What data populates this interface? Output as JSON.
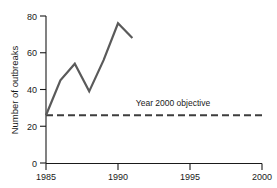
{
  "chart_data": {
    "type": "line",
    "title": "",
    "xlabel": "",
    "ylabel": "Number of outbreaks",
    "xlim": [
      1985,
      2000
    ],
    "ylim": [
      0,
      80
    ],
    "xticks": [
      "1985",
      "1990",
      "1995",
      "2000"
    ],
    "xtick_values": [
      1985,
      1990,
      1995,
      2000
    ],
    "yticks": [
      "0",
      "20",
      "40",
      "60",
      "80"
    ],
    "ytick_values": [
      0,
      20,
      40,
      60,
      80
    ],
    "grid": false,
    "legend": false,
    "series": [
      {
        "name": "Number of outbreaks",
        "style": "solid",
        "color": "#5a5a5a",
        "x": [
          1985,
          1986,
          1987,
          1988,
          1989,
          1990,
          1991
        ],
        "values": [
          26,
          45,
          54,
          39,
          56,
          76,
          68
        ]
      },
      {
        "name": "Year 2000 objective",
        "style": "dashed",
        "color": "#3d3d3d",
        "x": [
          1985,
          2000
        ],
        "values": [
          26,
          26
        ]
      }
    ],
    "annotations": [
      {
        "text": "Year 2000 objective",
        "x": 1996.4,
        "y": 31
      }
    ]
  }
}
